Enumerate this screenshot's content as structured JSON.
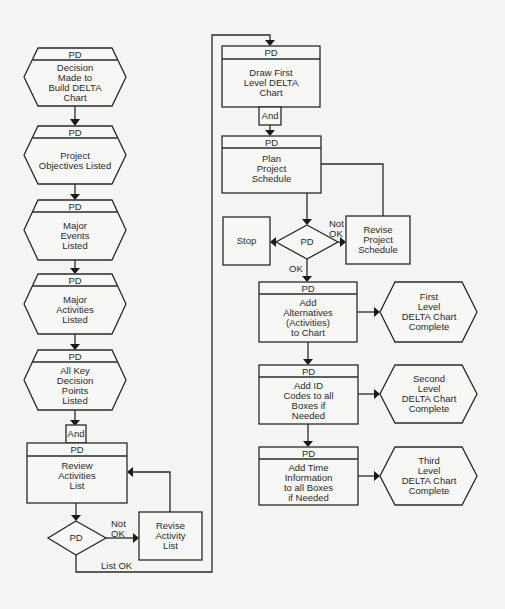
{
  "diagram": {
    "header_label": "PD",
    "left_column": {
      "hexagons": [
        {
          "header": "PD",
          "text": "Decision\nMade to\nBuild DELTA\nChart"
        },
        {
          "header": "PD",
          "text": "Project\nObjectives Listed"
        },
        {
          "header": "PD",
          "text": "Major\nEvents\nListed"
        },
        {
          "header": "PD",
          "text": "Major\nActivities\nListed"
        },
        {
          "header": "PD",
          "text": "All Key\nDecision\nPoints\nListed"
        }
      ],
      "and_label": "And",
      "review_box": {
        "header": "PD",
        "text": "Review\nActivities\nList"
      },
      "decision": {
        "text": "PD",
        "not_ok_label": "Not\nOK",
        "ok_label": "List OK"
      },
      "revise_box": {
        "text": "Revise\nActivity\nList"
      }
    },
    "right_column": {
      "draw_box": {
        "header": "PD",
        "text": "Draw First\nLevel DELTA\nChart"
      },
      "and_label": "And",
      "plan_box": {
        "header": "PD",
        "text": "Plan\nProject\nSchedule"
      },
      "stop_box": {
        "text": "Stop"
      },
      "decision": {
        "text": "PD",
        "not_ok_label": "Not\nOK",
        "ok_label": "OK"
      },
      "revise_box": {
        "text": "Revise\nProject\nSchedule"
      },
      "steps": [
        {
          "header": "PD",
          "text": "Add\nAlternatives\n(Activities)\nto Chart",
          "result": "First\nLevel\nDELTA Chart\nComplete"
        },
        {
          "header": "PD",
          "text": "Add ID\nCodes to all\nBoxes if\nNeeded",
          "result": "Second\nLevel\nDELTA Chart\nComplete"
        },
        {
          "header": "PD",
          "text": "Add Time\nInformation\nto all Boxes\nif Needed",
          "result": "Third\nLevel\nDELTA Chart\nComplete"
        }
      ]
    }
  }
}
